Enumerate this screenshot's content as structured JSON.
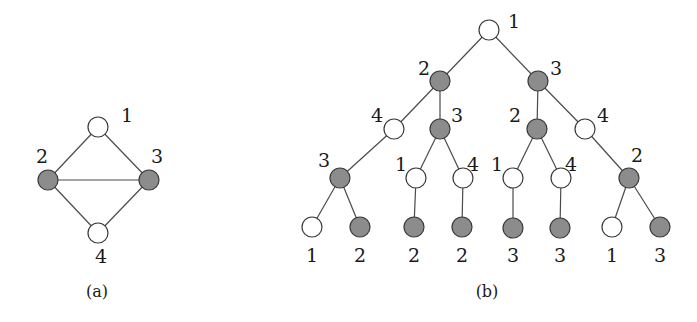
{
  "colors": {
    "white_node": "#ffffff",
    "gray_node": "#8c8c8c",
    "edge": "#4a4a4a",
    "text": "#1a1a1a"
  },
  "graph_a": {
    "caption": "(a)",
    "caption_pos": [
      97,
      297
    ],
    "nodes": [
      {
        "id": "a1",
        "label": "1",
        "x": 98,
        "y": 127,
        "fill": "white",
        "lx": 121,
        "ly": 122
      },
      {
        "id": "a2",
        "label": "2",
        "x": 48,
        "y": 180,
        "fill": "gray",
        "lx": 36,
        "ly": 163
      },
      {
        "id": "a3",
        "label": "3",
        "x": 149,
        "y": 180,
        "fill": "gray",
        "lx": 151,
        "ly": 163
      },
      {
        "id": "a4",
        "label": "4",
        "x": 98,
        "y": 233,
        "fill": "white",
        "lx": 95,
        "ly": 263
      }
    ],
    "edges": [
      [
        "a1",
        "a2"
      ],
      [
        "a1",
        "a3"
      ],
      [
        "a2",
        "a3"
      ],
      [
        "a2",
        "a4"
      ],
      [
        "a3",
        "a4"
      ]
    ]
  },
  "tree_b": {
    "caption": "(b)",
    "caption_pos": [
      487,
      297
    ],
    "nodes": [
      {
        "id": "r",
        "label": "1",
        "x": 489,
        "y": 30,
        "fill": "white",
        "lx": 508,
        "ly": 28
      },
      {
        "id": "L",
        "label": "2",
        "x": 440,
        "y": 81,
        "fill": "gray",
        "lx": 418,
        "ly": 75
      },
      {
        "id": "R",
        "label": "3",
        "x": 538,
        "y": 81,
        "fill": "gray",
        "lx": 550,
        "ly": 75
      },
      {
        "id": "LL",
        "label": "4",
        "x": 394,
        "y": 129,
        "fill": "white",
        "lx": 371,
        "ly": 122
      },
      {
        "id": "LR",
        "label": "3",
        "x": 440,
        "y": 129,
        "fill": "gray",
        "lx": 451,
        "ly": 122
      },
      {
        "id": "RL",
        "label": "2",
        "x": 537,
        "y": 129,
        "fill": "gray",
        "lx": 509,
        "ly": 122
      },
      {
        "id": "RR",
        "label": "4",
        "x": 585,
        "y": 129,
        "fill": "white",
        "lx": 597,
        "ly": 122
      },
      {
        "id": "LLL",
        "label": "3",
        "x": 340,
        "y": 178,
        "fill": "gray",
        "lx": 318,
        "ly": 167
      },
      {
        "id": "LRL",
        "label": "1",
        "x": 416,
        "y": 178,
        "fill": "white",
        "lx": 395,
        "ly": 171
      },
      {
        "id": "LRR",
        "label": "4",
        "x": 463,
        "y": 178,
        "fill": "white",
        "lx": 467,
        "ly": 171
      },
      {
        "id": "RLL",
        "label": "1",
        "x": 513,
        "y": 178,
        "fill": "white",
        "lx": 491,
        "ly": 171
      },
      {
        "id": "RLR",
        "label": "4",
        "x": 561,
        "y": 178,
        "fill": "white",
        "lx": 565,
        "ly": 171
      },
      {
        "id": "RRR",
        "label": "2",
        "x": 629,
        "y": 178,
        "fill": "gray",
        "lx": 631,
        "ly": 162
      },
      {
        "id": "l1",
        "label": "1",
        "x": 312,
        "y": 227,
        "fill": "white",
        "lx": 306,
        "ly": 262
      },
      {
        "id": "l2",
        "label": "2",
        "x": 360,
        "y": 227,
        "fill": "gray",
        "lx": 354,
        "ly": 262
      },
      {
        "id": "l3",
        "label": "2",
        "x": 414,
        "y": 227,
        "fill": "gray",
        "lx": 408,
        "ly": 262
      },
      {
        "id": "l4",
        "label": "2",
        "x": 462,
        "y": 227,
        "fill": "gray",
        "lx": 456,
        "ly": 262
      },
      {
        "id": "l5",
        "label": "3",
        "x": 513,
        "y": 228,
        "fill": "gray",
        "lx": 507,
        "ly": 262
      },
      {
        "id": "l6",
        "label": "3",
        "x": 560,
        "y": 228,
        "fill": "gray",
        "lx": 554,
        "ly": 262
      },
      {
        "id": "l7",
        "label": "1",
        "x": 612,
        "y": 227,
        "fill": "white",
        "lx": 606,
        "ly": 262
      },
      {
        "id": "l8",
        "label": "3",
        "x": 660,
        "y": 227,
        "fill": "gray",
        "lx": 654,
        "ly": 262
      }
    ],
    "edges": [
      [
        "r",
        "L"
      ],
      [
        "r",
        "R"
      ],
      [
        "L",
        "LL"
      ],
      [
        "L",
        "LR"
      ],
      [
        "R",
        "RL"
      ],
      [
        "R",
        "RR"
      ],
      [
        "LL",
        "LLL"
      ],
      [
        "LR",
        "LRL"
      ],
      [
        "LR",
        "LRR"
      ],
      [
        "RL",
        "RLL"
      ],
      [
        "RL",
        "RLR"
      ],
      [
        "RR",
        "RRR"
      ],
      [
        "LLL",
        "l1"
      ],
      [
        "LLL",
        "l2"
      ],
      [
        "LRL",
        "l3"
      ],
      [
        "LRR",
        "l4"
      ],
      [
        "RLL",
        "l5"
      ],
      [
        "RLR",
        "l6"
      ],
      [
        "RRR",
        "l7"
      ],
      [
        "RRR",
        "l8"
      ]
    ]
  }
}
